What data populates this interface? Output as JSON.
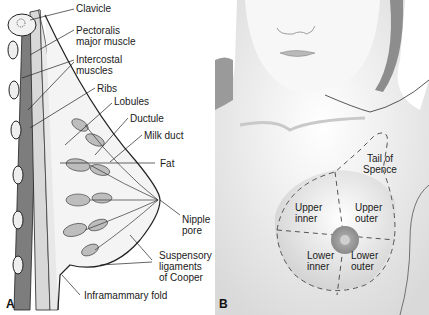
{
  "figure": {
    "panels": [
      {
        "id": "A",
        "letter": "A",
        "labels": {
          "clavicle": "Clavicle",
          "pectoralis_1": "Pectoralis",
          "pectoralis_2": "major muscle",
          "intercostal_1": "Intercostal",
          "intercostal_2": "muscles",
          "ribs": "Ribs",
          "lobules": "Lobules",
          "ductule": "Ductule",
          "milk_duct": "Milk duct",
          "fat": "Fat",
          "nipple_1": "Nipple",
          "nipple_2": "pore",
          "suspensory_1": "Suspensory",
          "suspensory_2": "ligaments",
          "suspensory_3": "of Cooper",
          "inframammary": "Inframammary fold"
        }
      },
      {
        "id": "B",
        "letter": "B",
        "labels": {
          "tail_1": "Tail of",
          "tail_2": "Spence",
          "upper_inner_1": "Upper",
          "upper_inner_2": "inner",
          "upper_outer_1": "Upper",
          "upper_outer_2": "outer",
          "lower_inner_1": "Lower",
          "lower_inner_2": "inner",
          "lower_outer_1": "Lower",
          "lower_outer_2": "outer"
        }
      }
    ]
  }
}
